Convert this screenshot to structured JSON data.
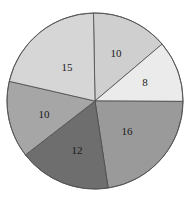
{
  "chart_data": {
    "type": "pie",
    "title": "",
    "xlabel": "",
    "ylabel": "",
    "legend": null,
    "total": 71,
    "start_angle_deg": -91,
    "direction": "clockwise",
    "center": [
      95,
      101
    ],
    "radius": 88,
    "categories": [
      "A",
      "B",
      "C",
      "D",
      "E",
      "F"
    ],
    "values": [
      10,
      8,
      16,
      12,
      10,
      15
    ],
    "labels": [
      "10",
      "8",
      "16",
      "12",
      "10",
      "15"
    ],
    "colors": [
      "#cfcfcf",
      "#ebebeb",
      "#9a9a9a",
      "#6e6e6e",
      "#a6a6a6",
      "#d6d6d6"
    ],
    "label_positions": [
      [
        116,
        53
      ],
      [
        145,
        82
      ],
      [
        127,
        131
      ],
      [
        77,
        150
      ],
      [
        44,
        114
      ],
      [
        67,
        67
      ]
    ]
  }
}
